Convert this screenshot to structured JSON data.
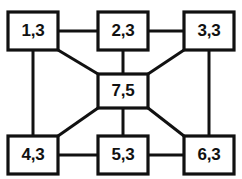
{
  "diagram": {
    "stroke_color": "#111111",
    "node_fill_color": "#ffffff",
    "background_color": "#ffffff",
    "nodes": [
      {
        "id": "n1",
        "label": "1,3",
        "x": 8,
        "y": 12,
        "w": 50,
        "h": 38,
        "position": "top-left"
      },
      {
        "id": "n2",
        "label": "2,3",
        "x": 98,
        "y": 12,
        "w": 50,
        "h": 38,
        "position": "top-center"
      },
      {
        "id": "n3",
        "label": "3,3",
        "x": 184,
        "y": 12,
        "w": 50,
        "h": 38,
        "position": "top-right"
      },
      {
        "id": "n7",
        "label": "7,5",
        "x": 98,
        "y": 74,
        "w": 50,
        "h": 34,
        "position": "center"
      },
      {
        "id": "n4",
        "label": "4,3",
        "x": 8,
        "y": 136,
        "w": 50,
        "h": 38,
        "position": "bottom-left"
      },
      {
        "id": "n5",
        "label": "5,3",
        "x": 98,
        "y": 136,
        "w": 50,
        "h": 38,
        "position": "bottom-center"
      },
      {
        "id": "n6",
        "label": "6,3",
        "x": 184,
        "y": 136,
        "w": 50,
        "h": 38,
        "position": "bottom-right"
      }
    ],
    "edges": [
      {
        "id": "e1",
        "from": "1,3",
        "to": "2,3",
        "kind": "horizontal",
        "x1": 58,
        "y1": 31,
        "x2": 98,
        "y2": 31
      },
      {
        "id": "e2",
        "from": "2,3",
        "to": "3,3",
        "kind": "horizontal",
        "x1": 148,
        "y1": 31,
        "x2": 184,
        "y2": 31
      },
      {
        "id": "e3",
        "from": "1,3",
        "to": "4,3",
        "kind": "vertical",
        "x1": 33,
        "y1": 50,
        "x2": 33,
        "y2": 136
      },
      {
        "id": "e4",
        "from": "3,3",
        "to": "6,3",
        "kind": "vertical",
        "x1": 209,
        "y1": 50,
        "x2": 209,
        "y2": 136
      },
      {
        "id": "e5",
        "from": "2,3",
        "to": "7,5",
        "kind": "vertical",
        "x1": 123,
        "y1": 50,
        "x2": 123,
        "y2": 74
      },
      {
        "id": "e6",
        "from": "7,5",
        "to": "5,3",
        "kind": "vertical",
        "x1": 123,
        "y1": 108,
        "x2": 123,
        "y2": 136
      },
      {
        "id": "e7",
        "from": "4,3",
        "to": "5,3",
        "kind": "horizontal",
        "x1": 58,
        "y1": 155,
        "x2": 98,
        "y2": 155
      },
      {
        "id": "e8",
        "from": "5,3",
        "to": "6,3",
        "kind": "horizontal",
        "x1": 148,
        "y1": 155,
        "x2": 184,
        "y2": 155
      },
      {
        "id": "e9",
        "from": "1,3",
        "to": "7,5",
        "kind": "diagonal",
        "x1": 58,
        "y1": 50,
        "x2": 98,
        "y2": 74
      },
      {
        "id": "e10",
        "from": "3,3",
        "to": "7,5",
        "kind": "diagonal",
        "x1": 184,
        "y1": 50,
        "x2": 148,
        "y2": 74
      },
      {
        "id": "e11",
        "from": "4,3",
        "to": "7,5",
        "kind": "diagonal",
        "x1": 58,
        "y1": 136,
        "x2": 98,
        "y2": 108
      },
      {
        "id": "e12",
        "from": "6,3",
        "to": "7,5",
        "kind": "diagonal",
        "x1": 184,
        "y1": 136,
        "x2": 148,
        "y2": 108
      }
    ]
  }
}
